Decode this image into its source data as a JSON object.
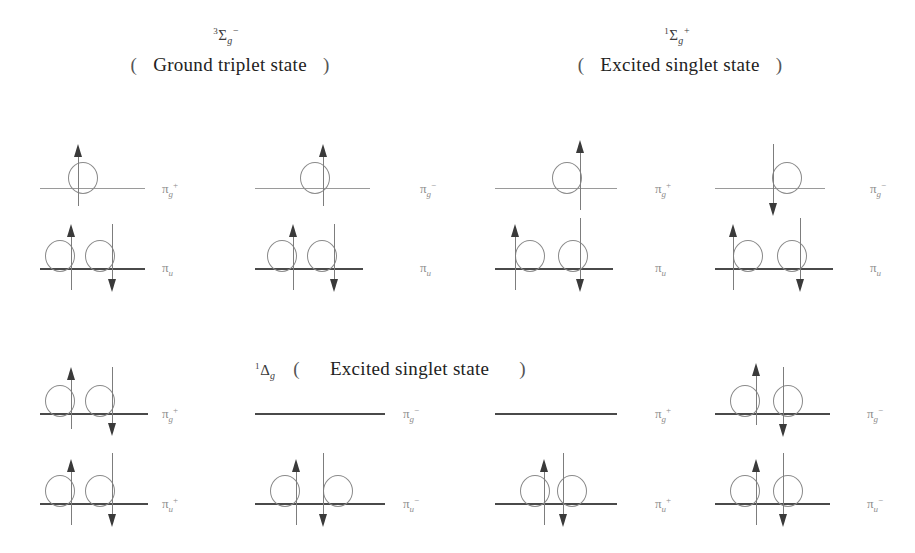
{
  "figure": {
    "background": "#ffffff",
    "line_color": "#6a6a6a",
    "arrow_color": "#3a3a3a",
    "label_color": "#8d8d8d"
  },
  "headers": [
    {
      "id": "ground-triplet",
      "term_pre_superscript": "3",
      "term_letter": "Σ",
      "term_subscript": "g",
      "term_superscript": "−",
      "open_paren": "(",
      "name": "Ground triplet state",
      "close_paren": ")"
    },
    {
      "id": "excited-singlet-sigma",
      "term_pre_superscript": "1",
      "term_letter": "Σ",
      "term_subscript": "g",
      "term_superscript": "+",
      "open_paren": "(",
      "name": "Excited singlet state",
      "close_paren": ")"
    },
    {
      "id": "excited-singlet-delta",
      "term_pre_superscript": "1",
      "term_letter": "Δ",
      "term_subscript": "g",
      "term_superscript": "",
      "open_paren": "(",
      "name": "Excited singlet state",
      "close_paren": ")"
    }
  ],
  "orbital_labels": {
    "antibonding": {
      "symbol": "π",
      "subscript": "g",
      "superscript_plus": "+",
      "superscript_minus": "−"
    },
    "bonding": {
      "symbol": "π",
      "subscript": "u",
      "superscript_plus": "+",
      "superscript_minus": "−"
    }
  },
  "panels": [
    {
      "id": "panel-1",
      "row": "top",
      "column": 1,
      "antibonding_label": "πg+",
      "bonding_label": "πu",
      "antibonding_electrons": [
        "up"
      ],
      "bonding_electrons": [
        "up",
        "down"
      ],
      "antibonding_lobes": 1,
      "bonding_lobes": 2
    },
    {
      "id": "panel-2",
      "row": "top",
      "column": 2,
      "antibonding_label": "πg−",
      "bonding_label": "πu",
      "antibonding_electrons": [
        "up"
      ],
      "bonding_electrons": [
        "up",
        "down"
      ],
      "antibonding_lobes": 1,
      "bonding_lobes": 2
    },
    {
      "id": "panel-3",
      "row": "top",
      "column": 3,
      "antibonding_label": "πg+",
      "bonding_label": "πu",
      "antibonding_electrons": [
        "up"
      ],
      "bonding_electrons": [
        "up",
        "down"
      ],
      "antibonding_lobes": 1,
      "bonding_lobes": 2
    },
    {
      "id": "panel-4",
      "row": "top",
      "column": 4,
      "antibonding_label": "πg−",
      "bonding_label": "πu",
      "antibonding_electrons": [
        "down"
      ],
      "bonding_electrons": [
        "up",
        "down"
      ],
      "antibonding_lobes": 1,
      "bonding_lobes": 2
    },
    {
      "id": "panel-5",
      "row": "bottom",
      "column": 1,
      "antibonding_label": "πg+",
      "bonding_label": "πu+",
      "antibonding_electrons": [
        "up",
        "down"
      ],
      "bonding_electrons": [
        "up",
        "down"
      ],
      "antibonding_lobes": 2,
      "bonding_lobes": 2
    },
    {
      "id": "panel-6",
      "row": "bottom",
      "column": 2,
      "antibonding_label": "πg−",
      "bonding_label": "πu−",
      "antibonding_electrons": [],
      "bonding_electrons": [
        "up",
        "down"
      ],
      "antibonding_lobes": 0,
      "bonding_lobes": 2
    },
    {
      "id": "panel-7",
      "row": "bottom",
      "column": 3,
      "antibonding_label": "πg+",
      "bonding_label": "πu+",
      "antibonding_electrons": [],
      "bonding_electrons": [
        "up",
        "down"
      ],
      "antibonding_lobes": 0,
      "bonding_lobes": 2
    },
    {
      "id": "panel-8",
      "row": "bottom",
      "column": 4,
      "antibonding_label": "πg−",
      "bonding_label": "πu−",
      "antibonding_electrons": [
        "up",
        "down"
      ],
      "bonding_electrons": [
        "up",
        "down"
      ],
      "antibonding_lobes": 2,
      "bonding_lobes": 2
    }
  ]
}
